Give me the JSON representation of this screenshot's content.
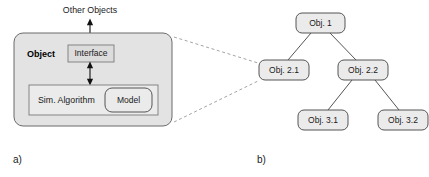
{
  "figure": {
    "panels": [
      {
        "id": "a",
        "label": "a)"
      },
      {
        "id": "b",
        "label": "b)"
      }
    ]
  },
  "panel_a": {
    "external_label": "Other Objects",
    "object_box": {
      "title": "Object",
      "fill": "#e3e3e3",
      "stroke": "#6b6b6b",
      "x": 14,
      "y": 33,
      "width": 158,
      "height": 93,
      "radius": 9
    },
    "interface_box": {
      "label": "Interface",
      "fill": "#dcdcdc",
      "stroke": "#7a7a7a",
      "x": 68,
      "y": 45,
      "width": 46,
      "height": 17
    },
    "algorithm_box": {
      "label": "Sim. Algorithm",
      "fill": "#ebebeb",
      "stroke": "#7a7a7a",
      "x": 29,
      "y": 85,
      "width": 129,
      "height": 30
    },
    "model_box": {
      "label": "Model",
      "fill": "#ebebeb",
      "stroke": "#555555",
      "x": 105,
      "y": 88,
      "width": 47,
      "height": 24,
      "radius": 7
    },
    "arrows": [
      {
        "name": "arrow-other-objects-to-interface",
        "x": 90,
        "y1": 19,
        "y2": 45,
        "double": true
      },
      {
        "name": "arrow-interface-to-algorithm",
        "x": 90,
        "y1": 62,
        "y2": 85,
        "double": true
      }
    ]
  },
  "panel_b": {
    "tree": {
      "node_fill": "#ebebeb",
      "node_stroke": "#555555",
      "nodes": [
        {
          "id": "obj1",
          "label": "Obj. 1",
          "x": 296,
          "y": 13,
          "width": 49,
          "height": 20,
          "level": 1
        },
        {
          "id": "obj21",
          "label": "Obj. 2.1",
          "x": 259,
          "y": 60,
          "width": 50,
          "height": 20,
          "level": 2
        },
        {
          "id": "obj22",
          "label": "Obj. 2.2",
          "x": 338,
          "y": 60,
          "width": 50,
          "height": 20,
          "level": 2
        },
        {
          "id": "obj31",
          "label": "Obj. 3.1",
          "x": 298,
          "y": 110,
          "width": 50,
          "height": 20,
          "level": 3
        },
        {
          "id": "obj32",
          "label": "Obj. 3.2",
          "x": 378,
          "y": 110,
          "width": 50,
          "height": 20,
          "level": 3
        }
      ],
      "edges": [
        {
          "from": "obj1",
          "to": "obj21"
        },
        {
          "from": "obj1",
          "to": "obj22"
        },
        {
          "from": "obj22",
          "to": "obj31"
        },
        {
          "from": "obj22",
          "to": "obj32"
        }
      ]
    }
  },
  "connectors": {
    "stroke": "#9a9a9a",
    "lines": [
      {
        "name": "zoom-line-top",
        "x1": 174,
        "y1": 37,
        "x2": 258,
        "y2": 63
      },
      {
        "name": "zoom-line-bottom",
        "x1": 174,
        "y1": 122,
        "x2": 258,
        "y2": 81
      }
    ]
  }
}
